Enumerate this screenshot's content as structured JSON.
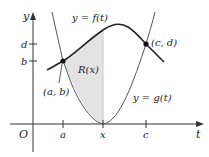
{
  "diagram": {
    "axes": {
      "x_label": "t",
      "y_label": "y",
      "origin_label": "O",
      "x_ticks": [
        {
          "label": "a",
          "x": 63
        },
        {
          "label": "x",
          "x": 103
        },
        {
          "label": "c",
          "x": 146
        }
      ],
      "y_ticks": [
        {
          "label": "d",
          "y": 44
        },
        {
          "label": "b",
          "y": 61
        }
      ]
    },
    "curves": {
      "f_label": "y = f(t)",
      "g_label": "y = g(t)"
    },
    "region_label": "R(x)",
    "points": [
      {
        "label": "(a, b)"
      },
      {
        "label": "(c, d)"
      }
    ],
    "colors": {
      "curve": "#222222",
      "axis": "#333333",
      "shade": "#e3e3e3",
      "divider": "#c8c8c8"
    }
  }
}
